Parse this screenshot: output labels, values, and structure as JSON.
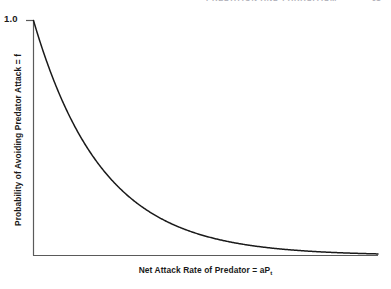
{
  "page": {
    "running_header": "PREDATION AND PARASITISM",
    "page_number": "91"
  },
  "figure": {
    "y_tick_label": "1.0",
    "y_axis_title": "Probability of Avoiding Predator Attack = f",
    "x_axis_title_main": "Net Attack Rate of Predator = aP",
    "x_axis_title_subscript": "t",
    "line_color": "#1a1a1a",
    "axis_color": "#5a5a5a"
  },
  "chart_data": {
    "type": "line",
    "title": "",
    "xlabel": "Net Attack Rate of Predator = aPt",
    "ylabel": "Probability of Avoiding Predator Attack = f",
    "grid": false,
    "legend": null,
    "xlim": [
      0,
      5
    ],
    "ylim": [
      0,
      1.0
    ],
    "y_ticks": [
      1.0
    ],
    "y_tick_labels": [
      "1.0"
    ],
    "x_ticks": [],
    "x_tick_labels": [],
    "equation": "f = exp(-a*P_t)",
    "series": [
      {
        "name": "f = exp(-aPt)",
        "x": [
          0.0,
          0.2,
          0.4,
          0.6,
          0.8,
          1.0,
          1.2,
          1.4,
          1.6,
          1.8,
          2.0,
          2.2,
          2.4,
          2.6,
          2.8,
          3.0,
          3.2,
          3.4,
          3.6,
          3.8,
          4.0,
          4.2,
          4.4,
          4.6,
          4.8,
          5.0
        ],
        "y": [
          1.0,
          0.819,
          0.67,
          0.549,
          0.449,
          0.368,
          0.301,
          0.247,
          0.202,
          0.165,
          0.135,
          0.111,
          0.091,
          0.074,
          0.061,
          0.05,
          0.041,
          0.033,
          0.027,
          0.022,
          0.018,
          0.015,
          0.012,
          0.01,
          0.008,
          0.007
        ]
      }
    ]
  }
}
